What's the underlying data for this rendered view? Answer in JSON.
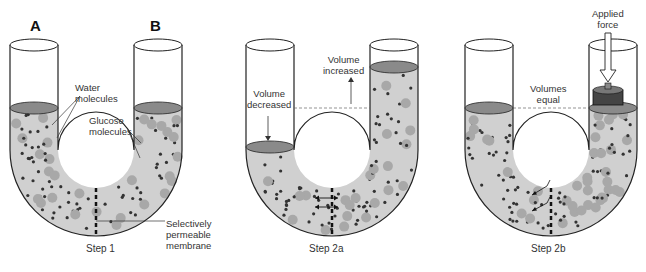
{
  "colors": {
    "fluid": "#d0d0d0",
    "surface": "#8a8a8a",
    "outline": "#222222",
    "water_molecule": "#333333",
    "glucose_molecule": "#a8a8a8",
    "background": "#ffffff"
  },
  "panels": [
    {
      "id": "step1",
      "caption": "Step 1",
      "tube_labels": [
        "A",
        "B"
      ],
      "labels": {
        "water": "Water\nmolecules",
        "glucose": "Glucose\nmolecules",
        "membrane": "Selectively\npermeable\nmembrane"
      }
    },
    {
      "id": "step2a",
      "caption": "Step 2a",
      "labels": {
        "decreased": "Volume\ndecreased",
        "increased": "Volume\nincreased"
      }
    },
    {
      "id": "step2b",
      "caption": "Step 2b",
      "labels": {
        "equal": "Volumes\nequal",
        "force": "Applied\nforce"
      }
    }
  ],
  "text": {
    "A": "A",
    "B": "B",
    "water1": "Water",
    "water2": "molecules",
    "glucose1": "Glucose",
    "glucose2": "molecules",
    "membrane1": "Selectively",
    "membrane2": "permeable",
    "membrane3": "membrane",
    "step1": "Step 1",
    "decreased1": "Volume",
    "decreased2": "decreased",
    "increased1": "Volume",
    "increased2": "increased",
    "step2a": "Step 2a",
    "equal1": "Volumes",
    "equal2": "equal",
    "force1": "Applied",
    "force2": "force",
    "step2b": "Step 2b"
  }
}
